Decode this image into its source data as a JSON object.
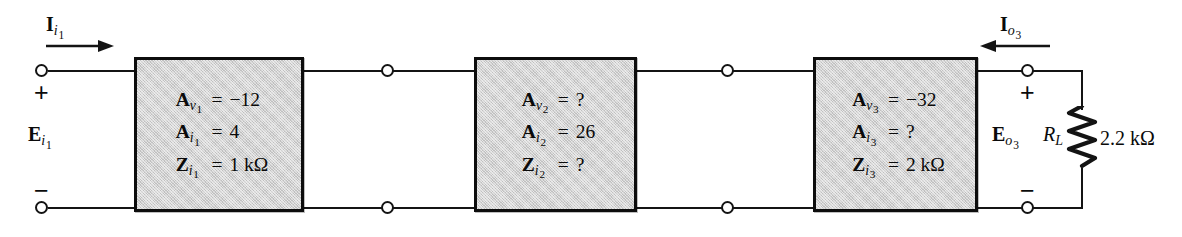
{
  "diagram": {
    "colors": {
      "line": "#141414",
      "block_fill": "#d2d2d2",
      "block_border": "#0d0d0d",
      "background": "#ffffff"
    },
    "input_port": {
      "current_label": {
        "symbol": "I",
        "sub_var": "i",
        "sub_num": "1"
      },
      "voltage_label": {
        "symbol": "E",
        "sub_var": "i",
        "sub_num": "1"
      },
      "plus_sign": "+",
      "minus_sign": "−"
    },
    "output_port": {
      "current_label": {
        "symbol": "I",
        "sub_var": "o",
        "sub_num": "3"
      },
      "voltage_label": {
        "symbol": "E",
        "sub_var": "o",
        "sub_num": "3"
      },
      "plus_sign": "+",
      "minus_sign": "−"
    },
    "load": {
      "symbol": "R",
      "sub": "L",
      "value": "2.2 kΩ"
    },
    "stages": [
      {
        "index": "1",
        "rows": [
          {
            "symbol": "A",
            "sub_var": "v",
            "sub_num": "1",
            "eq": "=",
            "value": "−12"
          },
          {
            "symbol": "A",
            "sub_var": "i",
            "sub_num": "1",
            "eq": "=",
            "value": "4"
          },
          {
            "symbol": "Z",
            "sub_var": "i",
            "sub_num": "1",
            "eq": "=",
            "value": "1 kΩ"
          }
        ]
      },
      {
        "index": "2",
        "rows": [
          {
            "symbol": "A",
            "sub_var": "v",
            "sub_num": "2",
            "eq": "=",
            "value": "?"
          },
          {
            "symbol": "A",
            "sub_var": "i",
            "sub_num": "2",
            "eq": "=",
            "value": "26"
          },
          {
            "symbol": "Z",
            "sub_var": "i",
            "sub_num": "2",
            "eq": "=",
            "value": "?"
          }
        ]
      },
      {
        "index": "3",
        "rows": [
          {
            "symbol": "A",
            "sub_var": "v",
            "sub_num": "3",
            "eq": "=",
            "value": "−32"
          },
          {
            "symbol": "A",
            "sub_var": "i",
            "sub_num": "3",
            "eq": "=",
            "value": "?"
          },
          {
            "symbol": "Z",
            "sub_var": "i",
            "sub_num": "3",
            "eq": "=",
            "value": "2 kΩ"
          }
        ]
      }
    ]
  }
}
